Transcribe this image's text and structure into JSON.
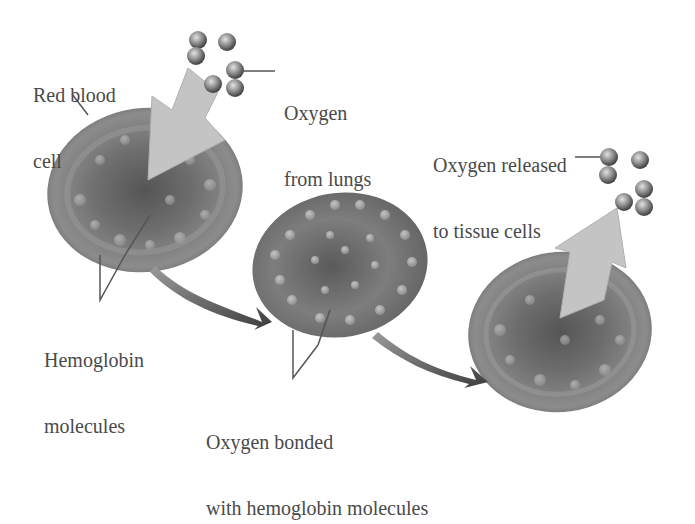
{
  "diagram": {
    "labels": {
      "red_blood_cell": [
        "Red blood",
        "cell"
      ],
      "oxygen_from_lungs": [
        "Oxygen",
        "from lungs"
      ],
      "oxygen_released": [
        "Oxygen released",
        "to tissue cells"
      ],
      "hemoglobin": [
        "Hemoglobin",
        "molecules"
      ],
      "oxygen_bonded": [
        "Oxygen bonded",
        "with hemoglobin molecules"
      ]
    },
    "stages": [
      {
        "name": "Red blood cell receiving oxygen"
      },
      {
        "name": "Oxygen bonded cell"
      },
      {
        "name": "Cell releasing oxygen"
      }
    ],
    "colors": {
      "cell_dark": "#4f4f4f",
      "cell_mid": "#7a7a7a",
      "cell_light": "#a9a9a9",
      "arrow_light": "#c2c2c2",
      "arrow_dark": "#5a5a5a",
      "text": "#4a4a4a"
    }
  }
}
